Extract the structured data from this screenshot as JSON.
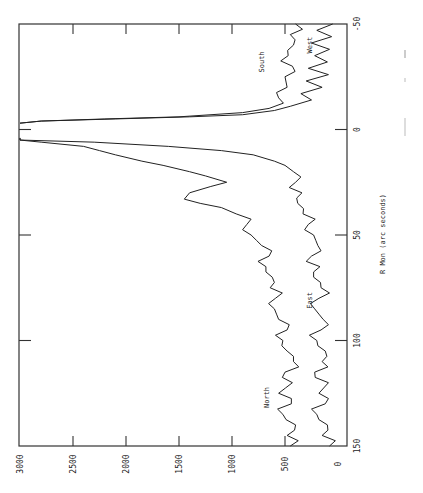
{
  "chart_data": {
    "type": "line",
    "orientation": "rotated 90° counter-clockwise (x-axis vertical on right, y-axis horizontal at bottom)",
    "title": "",
    "xlabel": "R Mon (arc seconds)",
    "ylabel": "",
    "xlim": [
      150,
      -50
    ],
    "ylim": [
      0,
      3000
    ],
    "x_ticks": [
      "150",
      "100",
      "50",
      "0",
      "-50"
    ],
    "y_ticks": [
      "0",
      "500",
      "1000",
      "1500",
      "2000",
      "2500",
      "3000"
    ],
    "grid": false,
    "legend": "inline curve labels",
    "series": [
      {
        "name": "North",
        "x": [
          150,
          145,
          140,
          135,
          130,
          125,
          120,
          115,
          110,
          105,
          100,
          95,
          90,
          85,
          80,
          75,
          70,
          65,
          60,
          55,
          50,
          45,
          40,
          37,
          35,
          33,
          30,
          27,
          25,
          22,
          20,
          17,
          15,
          12,
          10,
          8,
          6,
          5,
          4
        ],
        "y": [
          450,
          480,
          400,
          520,
          440,
          560,
          430,
          500,
          420,
          480,
          520,
          480,
          560,
          600,
          590,
          640,
          620,
          680,
          650,
          720,
          820,
          860,
          960,
          1100,
          1300,
          1450,
          1400,
          1200,
          1050,
          1250,
          1400,
          1650,
          1850,
          2100,
          2250,
          2400,
          2800,
          3000,
          3000
        ]
      },
      {
        "name": "East",
        "x": [
          150,
          145,
          140,
          135,
          130,
          125,
          120,
          115,
          110,
          105,
          100,
          95,
          90,
          85,
          80,
          75,
          70,
          65,
          60,
          55,
          50,
          45,
          40,
          35,
          30,
          25,
          20,
          17,
          15,
          12,
          10,
          8,
          6,
          5,
          4
        ],
        "y": [
          80,
          150,
          100,
          200,
          120,
          180,
          90,
          220,
          150,
          120,
          200,
          160,
          140,
          220,
          180,
          160,
          230,
          170,
          250,
          190,
          230,
          280,
          330,
          380,
          340,
          400,
          420,
          500,
          600,
          800,
          1100,
          1600,
          2300,
          3000,
          3000
        ]
      },
      {
        "name": "South",
        "x": [
          -50,
          -45,
          -40,
          -35,
          -30,
          -25,
          -20,
          -15,
          -10,
          -8,
          -6,
          -5,
          -4,
          -3
        ],
        "y": [
          400,
          450,
          420,
          470,
          430,
          500,
          480,
          560,
          650,
          900,
          1500,
          2200,
          2800,
          3000
        ]
      },
      {
        "name": "West",
        "x": [
          -50,
          -47,
          -44,
          -41,
          -38,
          -35,
          -32,
          -29,
          -26,
          -23,
          -20,
          -17,
          -14,
          -11,
          -9,
          -7,
          -6,
          -5,
          -4,
          -3
        ],
        "y": [
          50,
          200,
          60,
          250,
          80,
          220,
          100,
          280,
          90,
          300,
          150,
          350,
          250,
          450,
          600,
          900,
          1400,
          2100,
          2800,
          3000
        ]
      }
    ],
    "annotations": [
      {
        "text": "North",
        "at_x": 127,
        "at_y": 650
      },
      {
        "text": "East",
        "at_x": 81,
        "at_y": 250
      },
      {
        "text": "South",
        "at_x": -32,
        "at_y": 700
      },
      {
        "text": "West",
        "at_x": -40,
        "at_y": 250
      }
    ]
  },
  "labels": {
    "xlabel": "R Mon (arc seconds)",
    "north": "North",
    "east": "East",
    "south": "South",
    "west": "West"
  }
}
